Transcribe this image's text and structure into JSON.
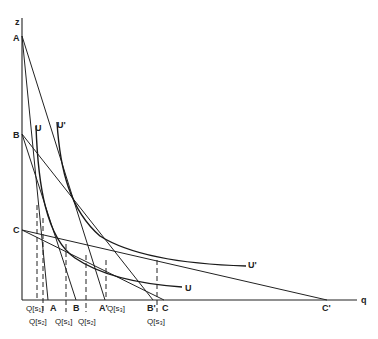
{
  "diagram": {
    "axes": {
      "vertical_label": "z",
      "horizontal_label": "q"
    },
    "intercepts_vertical": [
      {
        "id": "A",
        "label": "A"
      },
      {
        "id": "B",
        "label": "B"
      },
      {
        "id": "C",
        "label": "C"
      }
    ],
    "budget_lines": [
      {
        "from": "A",
        "to_label": "A",
        "name": "A-A"
      },
      {
        "from": "A",
        "to_label": "A'",
        "name": "A-A-prime"
      },
      {
        "from": "B",
        "to_label": "B",
        "name": "B-B"
      },
      {
        "from": "B",
        "to_label": "B'",
        "name": "B-B-prime"
      },
      {
        "from": "C",
        "to_label": "C",
        "name": "C-C"
      },
      {
        "from": "C",
        "to_label": "C'",
        "name": "C-C-prime"
      }
    ],
    "indifference_curves": [
      {
        "label": "U",
        "top_label": "U"
      },
      {
        "label": "U'",
        "top_label": "U'"
      }
    ],
    "quantity_labels": [
      {
        "label": "Q(s1)",
        "row": "top"
      },
      {
        "label": "Q(s2)",
        "row": "bottom"
      },
      {
        "label": "Q(s1)",
        "row": "bottom"
      },
      {
        "label": "Q(s2)",
        "row": "bottom"
      },
      {
        "label": "Q(s3)",
        "row": "top"
      },
      {
        "label": "Q(s3)",
        "row": "bottom"
      }
    ],
    "texts": {
      "z": "z",
      "q": "q",
      "A": "A",
      "B": "B",
      "C": "C",
      "A_end": "A",
      "A_prime": "A'",
      "B_end": "B",
      "B_prime": "B'",
      "C_end": "C",
      "C_prime": "C'",
      "U_top": "U",
      "U_prime_top": "U'",
      "U_end": "U",
      "U_prime_end": "U'",
      "Qs1_top": "Q[s₁]",
      "Qs2_low": "Q[s₂]",
      "Qs1_low": "Q[s₁]",
      "Qs2_mid": "Q[s₂]",
      "Qs3_top": "Q[s₃]",
      "Qs3_low": "Q[s₃]"
    }
  }
}
